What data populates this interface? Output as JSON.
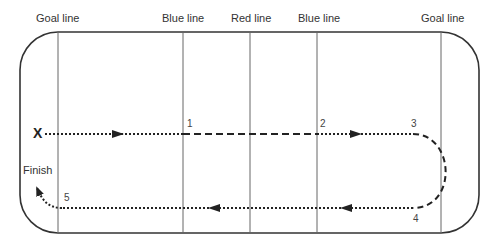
{
  "diagram": {
    "type": "hockey-rink-skating-drill",
    "line_labels": [
      {
        "id": "goal-line-left",
        "text": "Goal line",
        "x": 58
      },
      {
        "id": "blue-line-left",
        "text": "Blue line",
        "x": 183
      },
      {
        "id": "red-line",
        "text": "Red line",
        "x": 250
      },
      {
        "id": "blue-line-right",
        "text": "Blue line",
        "x": 317
      },
      {
        "id": "goal-line-right",
        "text": "Goal line",
        "x": 441
      }
    ],
    "start_marker": "X",
    "finish_label": "Finish",
    "waypoints": [
      "1",
      "2",
      "3",
      "4",
      "5"
    ],
    "path_legend": {
      "dotted": "skate",
      "dashed": "sprint"
    },
    "colors": {
      "lines": "#555555",
      "border": "#333333",
      "path": "#222222",
      "text": "#333333"
    }
  }
}
